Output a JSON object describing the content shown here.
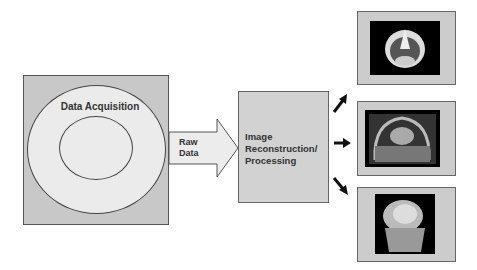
{
  "diagram": {
    "acquisition": {
      "label": "Data Acquisition"
    },
    "transfer": {
      "label_line1": "Raw",
      "label_line2": "Data"
    },
    "processing": {
      "label_line1": "Image",
      "label_line2": "Reconstruction/",
      "label_line3": "Processing"
    },
    "outputs": [
      {
        "name": "axial-head-scan"
      },
      {
        "name": "coronal-chest-scan"
      },
      {
        "name": "3d-knee-rendering"
      }
    ]
  }
}
